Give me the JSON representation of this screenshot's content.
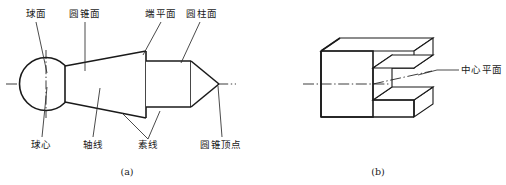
{
  "figure": {
    "background_color": "#ffffff",
    "line_color": "#1a1a1a",
    "sub_figures": [
      {
        "caption": "(a)",
        "kind": "revolution-solid-orthographic"
      },
      {
        "caption": "(b)",
        "kind": "channel-block-isometric"
      }
    ]
  },
  "figure_a": {
    "caption": "(a)",
    "labels": {
      "spherical_surface": "球面",
      "conical_surface": "圆锥面",
      "end_flat_surface": "端平面",
      "cylindrical_surface": "圆柱面",
      "sphere_center": "球心",
      "axis_line": "轴线",
      "generatrix": "素线",
      "cone_apex": "圆锥顶点"
    }
  },
  "figure_b": {
    "caption": "(b)",
    "labels": {
      "center_plane": "中心平面"
    }
  }
}
